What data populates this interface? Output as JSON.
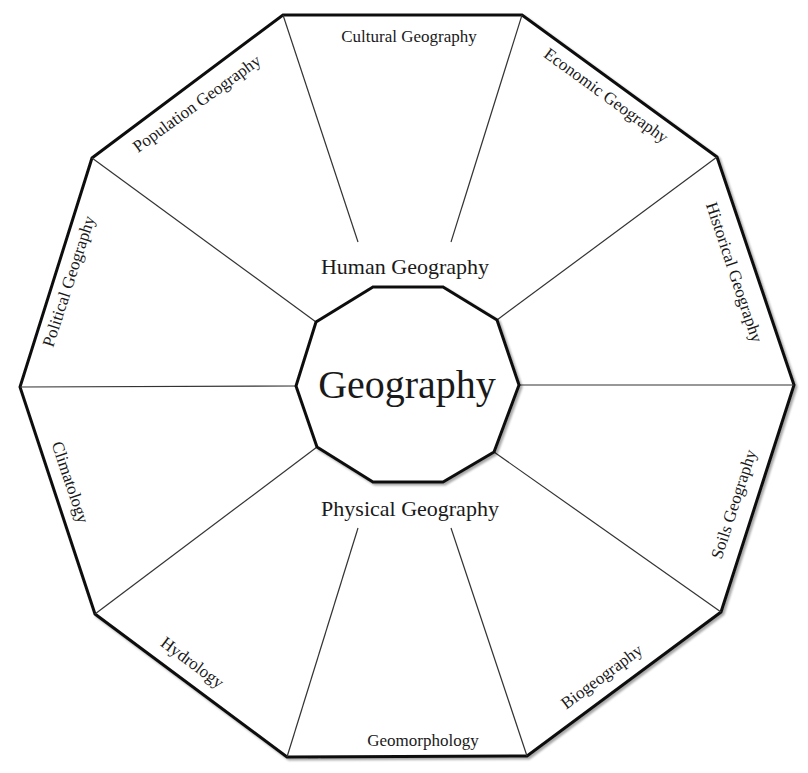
{
  "diagram": {
    "center_label": "Geography",
    "groups": {
      "human": "Human Geography",
      "physical": "Physical Geography"
    },
    "segments": [
      {
        "id": "cultural",
        "label": "Cultural Geography",
        "group": "human"
      },
      {
        "id": "economic",
        "label": "Economic Geography",
        "group": "human"
      },
      {
        "id": "historical",
        "label": "Historical Geography",
        "group": "human"
      },
      {
        "id": "soils",
        "label": "Soils Geography",
        "group": "physical"
      },
      {
        "id": "biogeography",
        "label": "Biogeography",
        "group": "physical"
      },
      {
        "id": "geomorphology",
        "label": "Geomorphology",
        "group": "physical"
      },
      {
        "id": "hydrology",
        "label": "Hydrology",
        "group": "physical"
      },
      {
        "id": "climatology",
        "label": "Climatology",
        "group": "physical"
      },
      {
        "id": "political",
        "label": "Political Geography",
        "group": "human"
      },
      {
        "id": "population",
        "label": "Population Geography",
        "group": "human"
      }
    ],
    "colors": {
      "outline": "#111111",
      "spokes": "#333333",
      "text": "#1a1a1a",
      "background": "#ffffff"
    }
  }
}
